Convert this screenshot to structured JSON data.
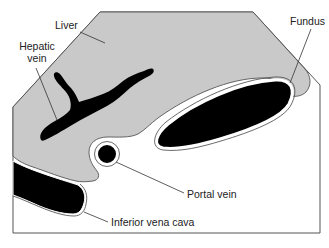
{
  "diagram": {
    "title": "",
    "colors": {
      "liver": "#c9c9c9",
      "vessel": "#000000",
      "outline": "#333333",
      "background": "#ffffff",
      "leader": "#333333"
    },
    "labels": {
      "liver": "Liver",
      "hepatic_vein_line1": "Hepatic",
      "hepatic_vein_line2": "vein",
      "fundus": "Fundus",
      "portal_vein": "Portal vein",
      "inferior_vena_cava": "Inferior vena cava"
    }
  }
}
